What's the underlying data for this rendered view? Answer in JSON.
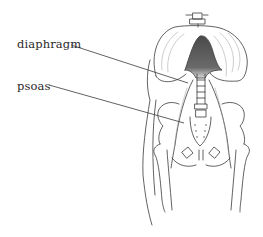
{
  "figure": {
    "type": "anatomical-illustration",
    "labels": [
      {
        "id": "diaphragm",
        "text": "diaphragm"
      },
      {
        "id": "psoas",
        "text": "psoas"
      }
    ],
    "colors": {
      "line": "#3a3a3a",
      "diaphragm_fill": "#5a5a5a",
      "background": "#ffffff"
    }
  }
}
